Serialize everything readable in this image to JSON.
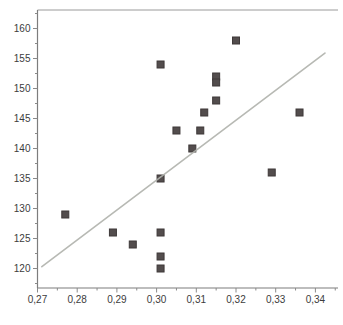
{
  "figure": {
    "background": "#ffffff"
  },
  "chart_data": {
    "type": "scatter",
    "title": "",
    "xlabel": "",
    "ylabel": "",
    "decimal_separator": ",",
    "x_tick_labels": [
      "0,27",
      "0,28",
      "0,29",
      "0,30",
      "0,31",
      "0,32",
      "0,33",
      "0,34"
    ],
    "x_tick_values": [
      0.27,
      0.28,
      0.29,
      0.3,
      0.31,
      0.32,
      0.33,
      0.34
    ],
    "x_minor_ticks": [
      0.275,
      0.285,
      0.295,
      0.305,
      0.315,
      0.325,
      0.335,
      0.345
    ],
    "y_tick_labels": [
      "120",
      "125",
      "130",
      "135",
      "140",
      "145",
      "150",
      "155",
      "160"
    ],
    "y_tick_values": [
      120,
      125,
      130,
      135,
      140,
      145,
      150,
      155,
      160
    ],
    "y_minor_ticks": [
      117.5,
      122.5,
      127.5,
      132.5,
      137.5,
      142.5,
      147.5,
      152.5,
      157.5,
      162.5
    ],
    "xlim": [
      0.268,
      0.346
    ],
    "ylim": [
      116.5,
      163
    ],
    "grid": false,
    "legend": null,
    "frame": [
      "top",
      "left",
      "bottom"
    ],
    "points": [
      {
        "x": 0.277,
        "y": 129
      },
      {
        "x": 0.289,
        "y": 126
      },
      {
        "x": 0.294,
        "y": 124
      },
      {
        "x": 0.301,
        "y": 154
      },
      {
        "x": 0.301,
        "y": 135
      },
      {
        "x": 0.301,
        "y": 126
      },
      {
        "x": 0.301,
        "y": 122
      },
      {
        "x": 0.301,
        "y": 120
      },
      {
        "x": 0.305,
        "y": 143
      },
      {
        "x": 0.311,
        "y": 143
      },
      {
        "x": 0.309,
        "y": 140
      },
      {
        "x": 0.312,
        "y": 146
      },
      {
        "x": 0.315,
        "y": 152
      },
      {
        "x": 0.315,
        "y": 151
      },
      {
        "x": 0.315,
        "y": 148
      },
      {
        "x": 0.32,
        "y": 158
      },
      {
        "x": 0.329,
        "y": 136
      },
      {
        "x": 0.336,
        "y": 146
      }
    ],
    "trendline": {
      "x1": 0.2711,
      "y1": 120.3,
      "x2": 0.3424,
      "y2": 155.9
    },
    "marker": {
      "shape": "square",
      "size_px": 7,
      "fill": "#534d4d",
      "stroke": "#3e3939"
    },
    "colors": {
      "axis": "#7d7d7d",
      "frame_top": "#9a9a9a",
      "tick": "#8a8a8a",
      "tick_label": "#3c3c3c",
      "trendline": "#b0b2ac"
    }
  }
}
